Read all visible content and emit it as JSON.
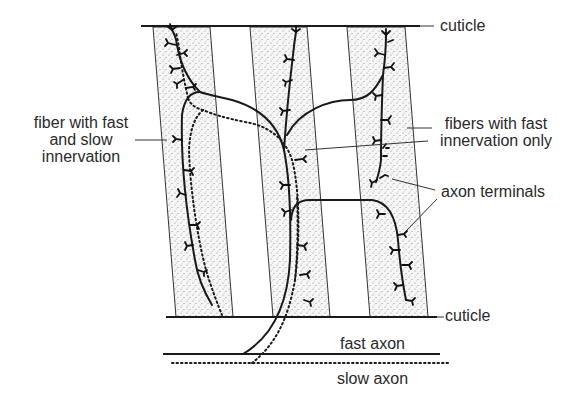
{
  "labels": {
    "cuticle_top": "cuticle",
    "cuticle_bottom": "cuticle",
    "fiber_fast_slow": [
      "fiber with fast",
      "and slow",
      "innervation"
    ],
    "fibers_fast_only": [
      "fibers with fast",
      "innervation only"
    ],
    "axon_terminals": "axon terminals",
    "fast_axon": "fast axon",
    "slow_axon": "slow axon"
  },
  "colors": {
    "ink": "#1a1a1a",
    "fiber_fill": "#f3f3f3",
    "stipple": "#8a8a8a",
    "text": "#2a2a2a"
  },
  "legend": {
    "fast_axon_style": "solid",
    "slow_axon_style": "dotted"
  }
}
